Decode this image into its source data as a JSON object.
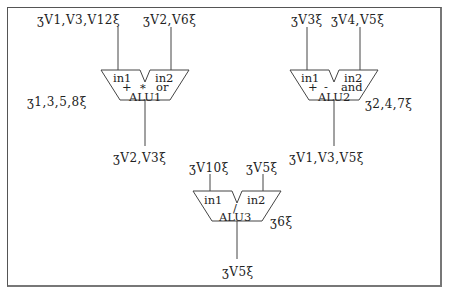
{
  "diagram": {
    "brackets": {
      "open": "ʒ",
      "close": "ξ"
    },
    "alus": [
      {
        "name": "ALU1",
        "in1_label": "in1",
        "in2_label": "in2",
        "ops": [
          "+",
          "*",
          "or"
        ],
        "in1_vars": "ʒV1,V3,V12ξ",
        "in2_vars": "ʒV2,V6ξ",
        "out_vars": "ʒV2,V3ξ",
        "steps": "ʒ1,3,5,8ξ"
      },
      {
        "name": "ALU2",
        "in1_label": "in1",
        "in2_label": "in2",
        "ops": [
          "+",
          "-",
          "and"
        ],
        "in1_vars": "ʒV3ξ",
        "in2_vars": "ʒV4,V5ξ",
        "out_vars": "ʒV1,V3,V5ξ",
        "steps": "ʒ2,4,7ξ"
      },
      {
        "name": "ALU3",
        "in1_label": "in1",
        "in2_label": "in2",
        "ops": [
          "/"
        ],
        "in1_vars": "ʒV10ξ",
        "in2_vars": "ʒV5ξ",
        "out_vars": "ʒV5ξ",
        "steps": "ʒ6ξ"
      }
    ]
  }
}
